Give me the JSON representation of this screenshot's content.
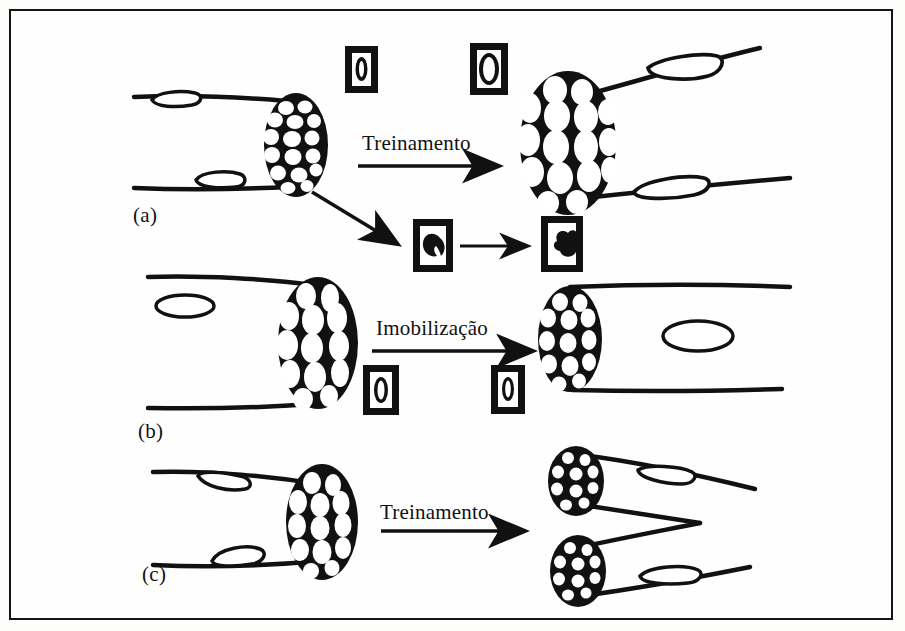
{
  "figure": {
    "type": "scientific-diagram",
    "language": "Portuguese",
    "border_color": "#141414",
    "ink_color": "#111111",
    "background_color": "#fefefe",
    "panels": [
      {
        "id": "a",
        "label": "(a)",
        "process_label": "Treinamento",
        "left_state": "normal muscle with many small fibers in cross-section",
        "right_state": "hypertrophied muscle with enlarged fibers",
        "inset_boxes": [
          {
            "name": "fiber-small",
            "position": "top-left",
            "content": "small muscle fiber cross-section"
          },
          {
            "name": "fiber-large",
            "position": "top-right",
            "content": "enlarged muscle fiber cross-section"
          },
          {
            "name": "satellite-cell-quiescent",
            "position": "lower-middle",
            "content": "quiescent satellite cell"
          },
          {
            "name": "satellite-cell-activated",
            "position": "lower-right",
            "content": "activated proliferating satellite cell"
          }
        ],
        "secondary_arrow": "diagonal arrow to satellite cell pathway"
      },
      {
        "id": "b",
        "label": "(b)",
        "process_label": "Imobilização",
        "left_state": "normal muscle with large fibers in cross-section",
        "right_state": "atrophied muscle with reduced fibers",
        "inset_boxes": [
          {
            "name": "fiber-normal",
            "position": "middle-left",
            "content": "muscle fiber cross-section"
          },
          {
            "name": "fiber-reduced",
            "position": "middle-right",
            "content": "reduced muscle fiber cross-section"
          }
        ]
      },
      {
        "id": "c",
        "label": "(c)",
        "process_label": "Treinamento",
        "left_state": "normal muscle with many fibers in cross-section",
        "right_state": "split muscle forming two separate fibers (hyperplasia)",
        "inset_boxes": []
      }
    ]
  }
}
